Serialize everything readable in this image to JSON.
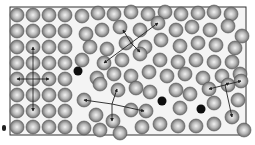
{
  "frame": {
    "x": 10,
    "y": 7,
    "w": 236,
    "h": 128,
    "stroke": "#333333",
    "fill": "#f4f4f4"
  },
  "colors": {
    "atom_light": "#f2f2f2",
    "atom_mid": "#b8b8b8",
    "atom_dark": "#6e6e6e",
    "atom_rim": "#555555",
    "defect": "#0e0e0e",
    "arrow": "#222222"
  },
  "atom_radius": 7,
  "grain_left": {
    "cols_x": [
      17,
      33,
      49,
      65
    ],
    "rows_y": [
      15,
      31,
      47,
      63,
      79,
      95,
      111,
      127
    ]
  },
  "atoms_right": [
    [
      82,
      16
    ],
    [
      98,
      13
    ],
    [
      114,
      14
    ],
    [
      131,
      12
    ],
    [
      148,
      14
    ],
    [
      165,
      12
    ],
    [
      181,
      14
    ],
    [
      198,
      13
    ],
    [
      214,
      12
    ],
    [
      231,
      14
    ],
    [
      86,
      34
    ],
    [
      102,
      30
    ],
    [
      120,
      27
    ],
    [
      140,
      30
    ],
    [
      158,
      23
    ],
    [
      176,
      30
    ],
    [
      192,
      27
    ],
    [
      210,
      30
    ],
    [
      228,
      26
    ],
    [
      242,
      36
    ],
    [
      90,
      47
    ],
    [
      107,
      49
    ],
    [
      126,
      43
    ],
    [
      145,
      47
    ],
    [
      161,
      40
    ],
    [
      180,
      46
    ],
    [
      198,
      43
    ],
    [
      216,
      45
    ],
    [
      235,
      48
    ],
    [
      82,
      60
    ],
    [
      104,
      63
    ],
    [
      122,
      60
    ],
    [
      140,
      54
    ],
    [
      160,
      60
    ],
    [
      178,
      62
    ],
    [
      196,
      60
    ],
    [
      214,
      62
    ],
    [
      232,
      62
    ],
    [
      97,
      78
    ],
    [
      114,
      74
    ],
    [
      131,
      76
    ],
    [
      149,
      72
    ],
    [
      167,
      76
    ],
    [
      185,
      74
    ],
    [
      203,
      78
    ],
    [
      222,
      76
    ],
    [
      240,
      74
    ],
    [
      84,
      100
    ],
    [
      100,
      84
    ],
    [
      118,
      90
    ],
    [
      136,
      88
    ],
    [
      150,
      92
    ],
    [
      176,
      90
    ],
    [
      190,
      94
    ],
    [
      209,
      89
    ],
    [
      228,
      85
    ],
    [
      241,
      81
    ],
    [
      96,
      115
    ],
    [
      113,
      121
    ],
    [
      131,
      110
    ],
    [
      146,
      111
    ],
    [
      180,
      108
    ],
    [
      214,
      103
    ],
    [
      238,
      100
    ],
    [
      84,
      128
    ],
    [
      100,
      130
    ],
    [
      120,
      133
    ],
    [
      142,
      127
    ],
    [
      160,
      124
    ],
    [
      178,
      126
    ],
    [
      196,
      126
    ],
    [
      214,
      124
    ],
    [
      232,
      117
    ],
    [
      244,
      130
    ]
  ],
  "defects": [
    [
      78,
      71
    ],
    [
      162,
      101
    ],
    [
      201,
      109
    ]
  ],
  "arrows": [
    {
      "from": [
        33,
        79
      ],
      "to": [
        33,
        47
      ]
    },
    {
      "from": [
        33,
        79
      ],
      "to": [
        33,
        111
      ]
    },
    {
      "from": [
        33,
        79
      ],
      "to": [
        17,
        79
      ]
    },
    {
      "from": [
        33,
        79
      ],
      "to": [
        49,
        79
      ]
    },
    {
      "from": [
        131,
        43
      ],
      "to": [
        123,
        30
      ]
    },
    {
      "from": [
        131,
        43
      ],
      "to": [
        158,
        23
      ]
    },
    {
      "from": [
        131,
        43
      ],
      "to": [
        140,
        52
      ]
    },
    {
      "from": [
        131,
        43
      ],
      "to": [
        104,
        63
      ]
    },
    {
      "from": [
        112,
        104
      ],
      "to": [
        84,
        100
      ]
    },
    {
      "from": [
        112,
        104
      ],
      "to": [
        144,
        111
      ]
    },
    {
      "from": [
        112,
        104
      ],
      "to": [
        117,
        89
      ]
    },
    {
      "from": [
        112,
        104
      ],
      "to": [
        112,
        121
      ]
    },
    {
      "from": [
        225,
        85
      ],
      "to": [
        209,
        89
      ]
    },
    {
      "from": [
        225,
        85
      ],
      "to": [
        241,
        81
      ]
    },
    {
      "from": [
        225,
        85
      ],
      "to": [
        229,
        83
      ]
    },
    {
      "from": [
        225,
        85
      ],
      "to": [
        232,
        117
      ]
    }
  ],
  "margin_dot": {
    "x": 2,
    "y": 128
  }
}
